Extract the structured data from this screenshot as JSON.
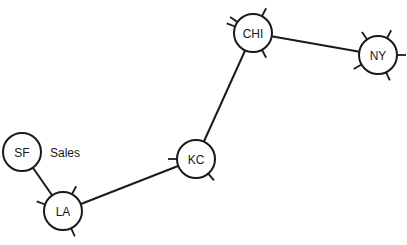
{
  "diagram": {
    "type": "network-topology",
    "colors": {
      "stroke": "#1a1a1a",
      "background": "#ffffff"
    },
    "nodes": [
      {
        "id": "SF",
        "label": "SF",
        "x": 22,
        "y": 152,
        "r": 19,
        "ticks": []
      },
      {
        "id": "LA",
        "label": "LA",
        "x": 63,
        "y": 211,
        "r": 19,
        "ticks": [
          -62,
          200,
          65
        ]
      },
      {
        "id": "KC",
        "label": "KC",
        "x": 196,
        "y": 159,
        "r": 19,
        "ticks": [
          180,
          50
        ]
      },
      {
        "id": "CHI",
        "label": "CHI",
        "x": 253,
        "y": 33,
        "r": 19,
        "ticks": [
          -145,
          -62,
          200,
          62
        ]
      },
      {
        "id": "NY",
        "label": "NY",
        "x": 378,
        "y": 55,
        "r": 19,
        "ticks": [
          -125,
          -62,
          0,
          150,
          65
        ]
      }
    ],
    "edges": [
      {
        "from": "SF",
        "to": "LA"
      },
      {
        "from": "LA",
        "to": "KC"
      },
      {
        "from": "KC",
        "to": "CHI"
      },
      {
        "from": "CHI",
        "to": "NY"
      }
    ],
    "annotations": [
      {
        "text": "Sales",
        "x": 50,
        "y": 157,
        "attached_to": "SF"
      }
    ]
  }
}
